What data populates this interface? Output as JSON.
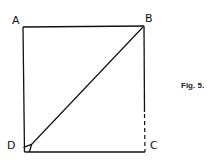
{
  "figure": {
    "caption": "Fig. 5.",
    "vertices": {
      "A": "A",
      "B": "B",
      "C": "C",
      "D": "D"
    },
    "edges": [
      {
        "from": "A",
        "to": "B",
        "style": "solid"
      },
      {
        "from": "A",
        "to": "D",
        "style": "solid"
      },
      {
        "from": "D",
        "to": "C",
        "style": "solid"
      },
      {
        "from": "B",
        "to": "C",
        "style": "solid-then-dashed"
      },
      {
        "from": "B",
        "to": "D",
        "style": "arrow"
      }
    ],
    "colors": {
      "stroke": "#111111",
      "background": "#ffffff"
    }
  }
}
